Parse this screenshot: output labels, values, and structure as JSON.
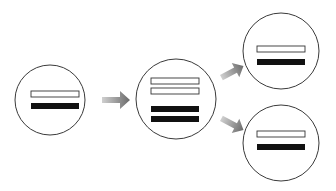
{
  "diagram": {
    "colors": {
      "background": "#ffffff",
      "circle_stroke": "#3a3a3a",
      "bar_outline": "#333333",
      "bar_fill_solid": "#111111",
      "bar_fill_hollow": "#ffffff",
      "arrow_dark": "#6e6e6e",
      "arrow_light": "#c8c8c8"
    },
    "nodes": [
      {
        "id": "left",
        "cx": 50,
        "cy": 100,
        "r": 35,
        "bars": [
          "hollow",
          "solid"
        ]
      },
      {
        "id": "middle",
        "cx": 176,
        "cy": 99,
        "r": 40,
        "bars": [
          "hollow",
          "hollow",
          "solid",
          "solid"
        ]
      },
      {
        "id": "top-right",
        "cx": 281,
        "cy": 51,
        "r": 38,
        "bars": [
          "hollow",
          "solid"
        ]
      },
      {
        "id": "bottom-right",
        "cx": 281,
        "cy": 143,
        "r": 38,
        "bars": [
          "hollow",
          "solid"
        ]
      }
    ],
    "edges": [
      {
        "from": "left",
        "to": "middle"
      },
      {
        "from": "middle",
        "to": "top-right"
      },
      {
        "from": "middle",
        "to": "bottom-right"
      }
    ]
  }
}
